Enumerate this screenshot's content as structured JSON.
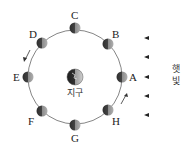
{
  "diagram": {
    "center_label": "지구",
    "sunlight_label_line1": "햇",
    "sunlight_label_line2": "빛",
    "moons": [
      {
        "label": "A"
      },
      {
        "label": "B"
      },
      {
        "label": "C"
      },
      {
        "label": "D"
      },
      {
        "label": "E"
      },
      {
        "label": "F"
      },
      {
        "label": "G"
      },
      {
        "label": "H"
      }
    ],
    "orbit_direction": "counterclockwise",
    "colors": {
      "orbit": "#555555",
      "moon_dark": "#3a3a3a",
      "moon_light": "#9a9a9a",
      "arrow": "#333333"
    }
  }
}
